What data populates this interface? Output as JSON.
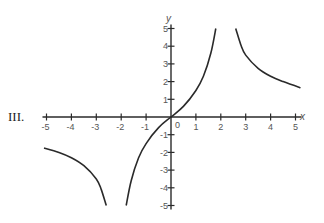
{
  "figure_label": "III.",
  "chart_data": {
    "type": "line",
    "title": "",
    "xlabel": "x",
    "ylabel": "y",
    "xlim": [
      -5,
      5
    ],
    "ylim": [
      -5,
      5
    ],
    "grid": false,
    "legend": null,
    "x_ticks": [
      "-5",
      "-4",
      "-3",
      "-2",
      "-1",
      "0",
      "1",
      "2",
      "3",
      "4",
      "5"
    ],
    "y_ticks": [
      "5",
      "4",
      "3",
      "2",
      "1",
      "-1",
      "-2",
      "-3",
      "-4",
      "-5"
    ],
    "origin_label": "0",
    "vertical_asymptotes": [
      -2.2,
      2.2
    ],
    "series": [
      {
        "name": "left-branch",
        "points": [
          [
            -5.1,
            -1.75
          ],
          [
            -4.5,
            -2.0
          ],
          [
            -4.0,
            -2.3
          ],
          [
            -3.5,
            -2.75
          ],
          [
            -3.0,
            -3.5
          ],
          [
            -2.8,
            -4.1
          ],
          [
            -2.6,
            -5.0
          ]
        ]
      },
      {
        "name": "middle-branch",
        "points": [
          [
            -1.8,
            -5.0
          ],
          [
            -1.6,
            -3.6
          ],
          [
            -1.3,
            -2.3
          ],
          [
            -1.0,
            -1.5
          ],
          [
            -0.5,
            -0.6
          ],
          [
            0.0,
            0.0
          ],
          [
            0.5,
            0.6
          ],
          [
            1.0,
            1.5
          ],
          [
            1.3,
            2.3
          ],
          [
            1.6,
            3.6
          ],
          [
            1.8,
            5.0
          ]
        ]
      },
      {
        "name": "right-branch",
        "points": [
          [
            2.6,
            5.0
          ],
          [
            2.8,
            4.1
          ],
          [
            3.0,
            3.5
          ],
          [
            3.5,
            2.75
          ],
          [
            4.0,
            2.3
          ],
          [
            4.5,
            2.0
          ],
          [
            5.2,
            1.65
          ]
        ]
      }
    ]
  }
}
